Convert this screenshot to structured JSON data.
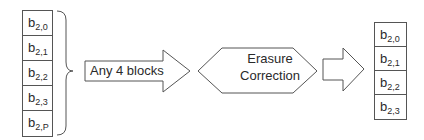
{
  "diagram": {
    "input_blocks": [
      {
        "base": "b",
        "sub": "2,0"
      },
      {
        "base": "b",
        "sub": "2,1"
      },
      {
        "base": "b",
        "sub": "2,2"
      },
      {
        "base": "b",
        "sub": "2,3"
      },
      {
        "base": "b",
        "sub": "2,P"
      }
    ],
    "arrow_label": "Any 4 blocks",
    "process": {
      "line1": "Erasure",
      "line2": "Correction"
    },
    "output_blocks": [
      {
        "base": "b",
        "sub": "2,0"
      },
      {
        "base": "b",
        "sub": "2,1"
      },
      {
        "base": "b",
        "sub": "2,2"
      },
      {
        "base": "b",
        "sub": "2,3"
      }
    ],
    "colors": {
      "stroke": "#555555",
      "text": "#2a2a2a",
      "background": "#ffffff"
    }
  }
}
